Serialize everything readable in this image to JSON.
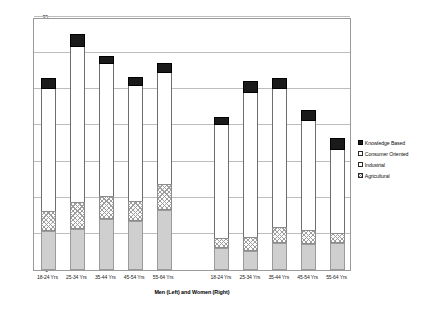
{
  "chart_data": {
    "type": "bar",
    "title": "",
    "subtitle": "",
    "xlabel": "Men (Left) and Women (Right)",
    "ylabel": "Business Creation Prevalence (#/100)",
    "ylim": [
      0,
      35
    ],
    "yticks": [
      0,
      5,
      10,
      15,
      20,
      25,
      30,
      35
    ],
    "ytick_labels": [
      "0",
      "5",
      "10",
      "15",
      "20",
      "25",
      "30",
      "35"
    ],
    "grid": true,
    "stacked": true,
    "legend_position": "right",
    "groups": [
      "Men",
      "Women"
    ],
    "categories": [
      "18-24 Yrs",
      "25-34 Yrs",
      "35-44 Yrs",
      "45-54 Yrs",
      "55-64 Yrs",
      "18-24 Yrs",
      "25-34 Yrs",
      "35-44 Yrs",
      "45-54 Yrs",
      "55-64 Yrs"
    ],
    "series": [
      {
        "name": "Agricultural",
        "color": "#ffffff",
        "pattern": "checkered",
        "values": [
          2.7,
          3.7,
          3.2,
          2.8,
          3.6,
          1.4,
          2.0,
          2.1,
          1.9,
          1.4
        ]
      },
      {
        "name": "Industrial",
        "color": "#cfcfcf",
        "pattern": "solid-gray",
        "values": [
          5.4,
          5.7,
          7.1,
          6.8,
          8.3,
          3.0,
          2.6,
          3.8,
          3.6,
          3.7
        ]
      },
      {
        "name": "Consumer Oriented",
        "color": "#ffffff",
        "pattern": "none",
        "values": [
          17.0,
          21.6,
          18.2,
          15.8,
          15.3,
          15.6,
          19.9,
          19.2,
          15.1,
          11.5
        ]
      },
      {
        "name": "Knowledge Based",
        "color": "#1a1a1a",
        "pattern": "solid-black",
        "values": [
          1.4,
          1.7,
          1.1,
          1.3,
          1.5,
          1.2,
          1.6,
          1.4,
          1.5,
          1.6
        ]
      }
    ],
    "bar_totals": [
      26.5,
      32.6,
      29.6,
      26.7,
      28.7,
      21.2,
      26.1,
      26.5,
      22.1,
      18.2
    ],
    "segment_tops": {
      "agricultural": [
        8.1,
        9.4,
        10.3,
        9.6,
        11.9,
        4.4,
        4.6,
        5.9,
        5.5,
        5.1
      ],
      "industrial": [
        5.4,
        5.7,
        7.1,
        6.8,
        8.3,
        3.0,
        2.6,
        3.8,
        3.6,
        3.7
      ],
      "consumer_top": [
        25.1,
        30.9,
        28.5,
        25.4,
        27.2,
        20.0,
        24.5,
        25.1,
        20.6,
        16.6
      ]
    }
  },
  "legend": {
    "items": [
      {
        "label": "Knowledge Based",
        "swatch": "knowledge-swatch-icon"
      },
      {
        "label": "Consumer Oriented",
        "swatch": "consumer-swatch-icon"
      },
      {
        "label": "Industrial",
        "swatch": "industrial-swatch-icon"
      },
      {
        "label": "Agricultural",
        "swatch": "agricultural-swatch-icon"
      }
    ]
  }
}
